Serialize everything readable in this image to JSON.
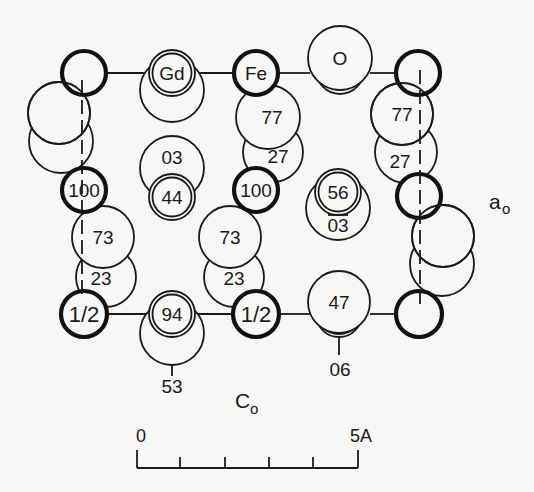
{
  "figure": {
    "axes": {
      "horizontal_label": "C",
      "horizontal_sub": "o",
      "vertical_label": "a",
      "vertical_sub": "o"
    },
    "scale_bar": {
      "start_label": "0",
      "end_label": "5A",
      "ticks": 6
    }
  },
  "atoms": {
    "fe_top_left": {
      "label": "",
      "type": "Fe"
    },
    "gd_top": {
      "label": "Gd",
      "type": "Gd"
    },
    "fe_top": {
      "label": "Fe",
      "type": "Fe"
    },
    "o_top": {
      "label": "O",
      "type": "O"
    },
    "fe_top_right": {
      "label": "",
      "type": "Fe"
    },
    "o_mid_77": {
      "label": "77"
    },
    "o_mid_27": {
      "label": "27"
    },
    "o_right_77": {
      "label": "77"
    },
    "o_right_27": {
      "label": "27"
    },
    "o_center_03": {
      "label": "03"
    },
    "gd_center_44": {
      "label": "44"
    },
    "fe_left_100": {
      "label": "100"
    },
    "fe_mid_100": {
      "label": "100"
    },
    "gd_right_56": {
      "label": "56"
    },
    "o_right_03bar": {
      "label": "03",
      "overbar": true
    },
    "o_left_73": {
      "label": "73"
    },
    "o_left_23": {
      "label": "23"
    },
    "o_mid_73": {
      "label": "73"
    },
    "o_mid_23": {
      "label": "23"
    },
    "fe_bottom_left_half": {
      "label": "1/2"
    },
    "gd_bottom_94": {
      "label": "94"
    },
    "o_bottom_53": {
      "label": "53"
    },
    "fe_bottom_mid_half": {
      "label": "1/2"
    },
    "o_bottom_47": {
      "label": "47"
    },
    "gd_bottom_06": {
      "label": "06"
    },
    "fe_bottom_right": {
      "label": ""
    }
  }
}
